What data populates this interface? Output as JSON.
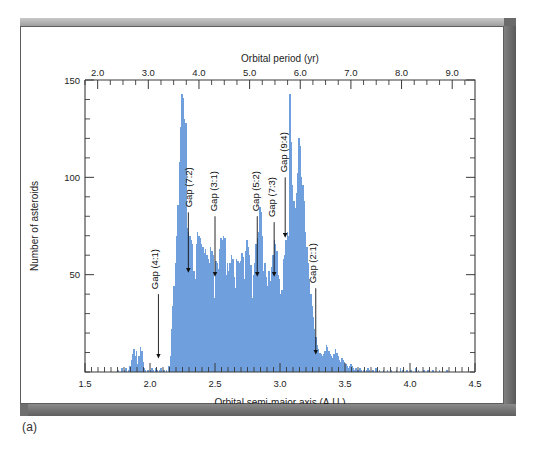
{
  "figure": {
    "caption": "(a)",
    "frame_color": "#5d5d5d",
    "bar_color": "#6f9fdc",
    "bar_edge_color": "#4f84c8"
  },
  "chart_data": {
    "type": "bar",
    "title": "",
    "xlabel": "Orbital semi-major axis (A.U.)",
    "ylabel": "Number of asteroids",
    "top_axis_label": "Orbital period (yr)",
    "xlim": [
      1.5,
      4.5
    ],
    "ylim": [
      0,
      150
    ],
    "top_xlim": [
      1.75,
      9.45
    ],
    "grid": false,
    "legend": null,
    "x_ticks": [
      1.5,
      2.0,
      2.5,
      3.0,
      3.5,
      4.0,
      4.5
    ],
    "x_ticklabels": [
      "1.5",
      "2.0",
      "2.5",
      "3.0",
      "3.5",
      "4.0",
      "4.5"
    ],
    "x_minor_step": 0.05,
    "y_ticks": [
      50,
      100,
      150
    ],
    "y_ticklabels": [
      "50",
      "100",
      "150"
    ],
    "y_minor_step": 10,
    "top_ticks": [
      2.0,
      3.0,
      4.0,
      5.0,
      6.0,
      7.0,
      8.0,
      9.0
    ],
    "top_ticklabels": [
      "2.0",
      "3.0",
      "4.0",
      "5.0",
      "6.0",
      "7.0",
      "8.0",
      "9.0"
    ],
    "top_minor_step": 0.25,
    "bin_width": 0.01,
    "bin_start": 1.5,
    "values": [
      0,
      0,
      0,
      0,
      0,
      0,
      0,
      0,
      0,
      0,
      0,
      0,
      0,
      0,
      0,
      0,
      0,
      0,
      0,
      0,
      0,
      0,
      0,
      0,
      0,
      1,
      0,
      0,
      2,
      0,
      1,
      2,
      0,
      1,
      3,
      6,
      9,
      12,
      8,
      11,
      4,
      8,
      13,
      11,
      5,
      2,
      1,
      0,
      1,
      0,
      1,
      2,
      1,
      0,
      2,
      1,
      0,
      1,
      2,
      0,
      1,
      0,
      1,
      0,
      3,
      8,
      22,
      34,
      44,
      56,
      70,
      86,
      108,
      126,
      143,
      141,
      130,
      128,
      74,
      72,
      70,
      68,
      66,
      52,
      48,
      66,
      72,
      70,
      69,
      66,
      64,
      61,
      63,
      60,
      58,
      56,
      64,
      62,
      60,
      38,
      57,
      56,
      53,
      63,
      69,
      68,
      70,
      69,
      50,
      56,
      52,
      56,
      60,
      58,
      49,
      43,
      58,
      57,
      56,
      57,
      61,
      59,
      48,
      62,
      68,
      64,
      60,
      55,
      38,
      50,
      56,
      66,
      69,
      72,
      85,
      82,
      70,
      52,
      56,
      49,
      44,
      52,
      47,
      54,
      60,
      68,
      66,
      62,
      50,
      48,
      40,
      42,
      58,
      60,
      68,
      72,
      70,
      143,
      118,
      96,
      88,
      84,
      92,
      102,
      120,
      116,
      100,
      96,
      88,
      72,
      64,
      56,
      48,
      40,
      34,
      28,
      22,
      18,
      14,
      12,
      10,
      9,
      8,
      9,
      11,
      14,
      13,
      11,
      9,
      8,
      7,
      9,
      12,
      10,
      8,
      6,
      5,
      7,
      6,
      5,
      4,
      3,
      2,
      3,
      4,
      3,
      2,
      1,
      2,
      1,
      1,
      2,
      1,
      0,
      1,
      0,
      1,
      2,
      1,
      0,
      0,
      1,
      0,
      2,
      1,
      0,
      1,
      0,
      0,
      1,
      0,
      0,
      1,
      0,
      0,
      1,
      0,
      0,
      0,
      1,
      0,
      0,
      2,
      0,
      1,
      0,
      0,
      1,
      0,
      0,
      1,
      0,
      0,
      0,
      2,
      0,
      1,
      0,
      0,
      0,
      1,
      0,
      0,
      1,
      0,
      0,
      0,
      1,
      0,
      0,
      0,
      0,
      1,
      0,
      0,
      0,
      0,
      0,
      1,
      0,
      0,
      0,
      0,
      0,
      0,
      0,
      0,
      0,
      0,
      0,
      0,
      0,
      0,
      0,
      0,
      0,
      0,
      0,
      0,
      0
    ],
    "annotations": [
      {
        "label": "Gap (4:1)",
        "x": 2.065,
        "arrow_tip_y": 8,
        "text_bottom_y": 40,
        "text_x": 2.065
      },
      {
        "label": "Gap (7:2)",
        "x": 2.295,
        "arrow_tip_y": 52,
        "text_bottom_y": 82,
        "text_x": 2.325
      },
      {
        "label": "Gap (3:1)",
        "x": 2.5,
        "arrow_tip_y": 50,
        "text_bottom_y": 80,
        "text_x": 2.512
      },
      {
        "label": "Gap (5:2)",
        "x": 2.825,
        "arrow_tip_y": 50,
        "text_bottom_y": 80,
        "text_x": 2.84
      },
      {
        "label": "Gap (7:3)",
        "x": 2.955,
        "arrow_tip_y": 50,
        "text_bottom_y": 77,
        "text_x": 2.958
      },
      {
        "label": "Gap (9:4)",
        "x": 3.04,
        "arrow_tip_y": 70,
        "text_bottom_y": 100,
        "text_x": 3.055
      },
      {
        "label": "Gap (2:1)",
        "x": 3.275,
        "arrow_tip_y": 10,
        "text_bottom_y": 43,
        "text_x": 3.275
      }
    ]
  }
}
